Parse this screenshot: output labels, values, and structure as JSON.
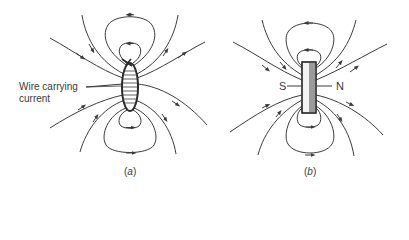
{
  "figure": {
    "panel_a": {
      "caption_open": "(",
      "caption_letter": "a",
      "caption_close": ")",
      "label_line1": "Wire carrying",
      "label_line2": "current",
      "object": "current-carrying coil (cross-section)"
    },
    "panel_b": {
      "caption_open": "(",
      "caption_letter": "b",
      "caption_close": ")",
      "south_label": "S",
      "north_label": "N",
      "object": "bar magnet"
    },
    "colors": {
      "line": "#3a3a3a",
      "magnet_fill_light": "#f2f2f2",
      "magnet_fill_dark": "#9a9a9a",
      "background": "#ffffff"
    }
  }
}
